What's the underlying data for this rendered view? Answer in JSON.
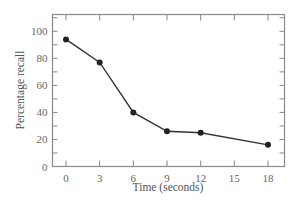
{
  "chart_data": {
    "type": "line",
    "title": "",
    "xlabel": "Time (seconds)",
    "ylabel": "Percentage recall",
    "x": [
      0,
      3,
      6,
      9,
      12,
      18
    ],
    "series": [
      {
        "name": "Percentage recall",
        "values": [
          94,
          77,
          40,
          26,
          25,
          16
        ]
      }
    ],
    "xticks": [
      0,
      3,
      6,
      9,
      12,
      15,
      18
    ],
    "yticks": [
      0,
      20,
      40,
      60,
      80,
      100
    ],
    "xlim": [
      -1.3,
      19
    ],
    "ylim": [
      0,
      112
    ],
    "grid": false,
    "legend": "none",
    "colors": {
      "line": "#333333",
      "marker": "#222222",
      "axis": "#888888"
    }
  }
}
